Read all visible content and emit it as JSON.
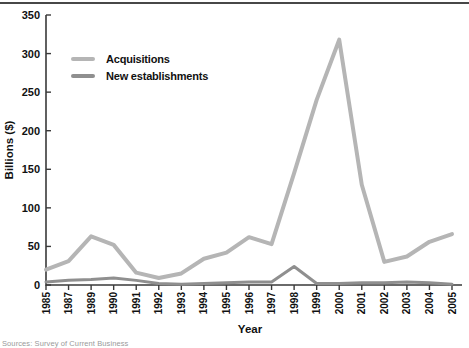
{
  "figure": {
    "top_rule_color": "#474747",
    "background": "#ffffff",
    "axis_color": "#3a3a3a",
    "text_color": "#111111"
  },
  "legend": {
    "items": [
      {
        "label": "Acquisitions",
        "color": "#b5b5b5"
      },
      {
        "label": "New establishments",
        "color": "#8f8f8f"
      }
    ]
  },
  "chart_data": {
    "type": "line",
    "title": "",
    "xlabel": "Year",
    "ylabel": "Billions ($)",
    "ylim": [
      0,
      350
    ],
    "yticks": [
      0,
      50,
      100,
      150,
      200,
      250,
      300,
      350
    ],
    "grid": false,
    "legend_position": "upper-left-inside",
    "categories": [
      "1985",
      "1987",
      "1989",
      "1990",
      "1991",
      "1992",
      "1993",
      "1994",
      "1995",
      "1996",
      "1997",
      "1998",
      "1999",
      "2000",
      "2001",
      "2002",
      "2003",
      "2004",
      "2005"
    ],
    "series": [
      {
        "name": "Acquisitions",
        "color": "#b5b5b5",
        "stroke_width": 4,
        "values": [
          20,
          31,
          63,
          52,
          16,
          9,
          15,
          34,
          42,
          62,
          53,
          145,
          240,
          318,
          130,
          30,
          37,
          56,
          66
        ]
      },
      {
        "name": "New establishments",
        "color": "#8f8f8f",
        "stroke_width": 3,
        "values": [
          4,
          6,
          7,
          9,
          6,
          2,
          1,
          2,
          3,
          4,
          4,
          24,
          2,
          2,
          3,
          3,
          4,
          3,
          1
        ]
      }
    ],
    "source_note": "Sources: Survey of Current Business"
  }
}
